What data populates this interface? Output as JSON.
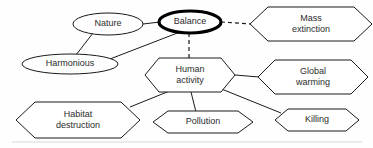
{
  "diagram": {
    "background_color": "#fefefe",
    "line_color": "#1a1a1a",
    "text_color": "#2b2b2b",
    "nodes": [
      {
        "id": "nature",
        "label": "Nature",
        "shape": "ellipse",
        "emphasis": false,
        "cx": 108,
        "cy": 24,
        "rx": 35,
        "ry": 11,
        "lines": [
          "Nature"
        ]
      },
      {
        "id": "balance",
        "label": "Balance",
        "shape": "ellipse",
        "emphasis": true,
        "cx": 190,
        "cy": 22,
        "rx": 31,
        "ry": 11,
        "lines": [
          "Balance"
        ]
      },
      {
        "id": "harmonious",
        "label": "Harmonious",
        "shape": "ellipse",
        "emphasis": false,
        "cx": 70,
        "cy": 64,
        "rx": 48,
        "ry": 10,
        "lines": [
          "Harmonious"
        ]
      },
      {
        "id": "mass-extinction",
        "label": "Mass extinction",
        "shape": "hexagon",
        "emphasis": false,
        "cx": 311,
        "cy": 24,
        "rx": 61,
        "ry": 17,
        "lines": [
          "Mass",
          "extinction"
        ]
      },
      {
        "id": "human-activity",
        "label": "Human activity",
        "shape": "hexagon",
        "emphasis": false,
        "cx": 190,
        "cy": 75,
        "rx": 45,
        "ry": 17,
        "lines": [
          "Human",
          "activity"
        ]
      },
      {
        "id": "global-warming",
        "label": "Global warming",
        "shape": "hexagon",
        "emphasis": false,
        "cx": 313,
        "cy": 77,
        "rx": 55,
        "ry": 17,
        "lines": [
          "Global",
          "warming"
        ]
      },
      {
        "id": "habitat-destruction",
        "label": "Habitat destruction",
        "shape": "hexagon",
        "emphasis": false,
        "cx": 78,
        "cy": 120,
        "rx": 62,
        "ry": 18,
        "lines": [
          "Habitat",
          "destruction"
        ]
      },
      {
        "id": "pollution",
        "label": "Pollution",
        "shape": "hexagon",
        "emphasis": false,
        "cx": 203,
        "cy": 122,
        "rx": 50,
        "ry": 11,
        "lines": [
          "Pollution"
        ]
      },
      {
        "id": "killing",
        "label": "Killing",
        "shape": "hexagon",
        "emphasis": false,
        "cx": 317,
        "cy": 120,
        "rx": 42,
        "ry": 11,
        "lines": [
          "Killing"
        ]
      }
    ],
    "edges": [
      {
        "id": "nature-balance",
        "from": "nature",
        "to": "balance",
        "style": "solid",
        "x1": 143,
        "y1": 24,
        "x2": 160,
        "y2": 22
      },
      {
        "id": "nature-harmonious",
        "from": "nature",
        "to": "harmonious",
        "style": "solid",
        "x1": 93,
        "y1": 33,
        "x2": 76,
        "y2": 55
      },
      {
        "id": "harmonious-balance",
        "from": "harmonious",
        "to": "balance",
        "style": "solid",
        "x1": 110,
        "y1": 59,
        "x2": 180,
        "y2": 32
      },
      {
        "id": "balance-mass-extinction",
        "from": "balance",
        "to": "mass-extinction",
        "style": "dashed",
        "x1": 221,
        "y1": 22,
        "x2": 251,
        "y2": 24
      },
      {
        "id": "balance-human-activity",
        "from": "balance",
        "to": "human-activity",
        "style": "dashed",
        "x1": 189,
        "y1": 33,
        "x2": 189,
        "y2": 58
      },
      {
        "id": "human-activity-global-warming",
        "from": "human-activity",
        "to": "global-warming",
        "style": "solid",
        "x1": 235,
        "y1": 75,
        "x2": 259,
        "y2": 77
      },
      {
        "id": "human-activity-habitat-destruction",
        "from": "human-activity",
        "to": "habitat-destruction",
        "style": "solid",
        "x1": 172,
        "y1": 90,
        "x2": 130,
        "y2": 107
      },
      {
        "id": "human-activity-pollution",
        "from": "human-activity",
        "to": "pollution",
        "style": "solid",
        "x1": 191,
        "y1": 92,
        "x2": 196,
        "y2": 112
      },
      {
        "id": "human-activity-killing",
        "from": "human-activity",
        "to": "killing",
        "style": "solid",
        "x1": 219,
        "y1": 88,
        "x2": 281,
        "y2": 113
      }
    ],
    "footer_rule": {
      "id": "footer-rule",
      "x1": 12,
      "y1": 142,
      "x2": 362,
      "y2": 142
    }
  }
}
